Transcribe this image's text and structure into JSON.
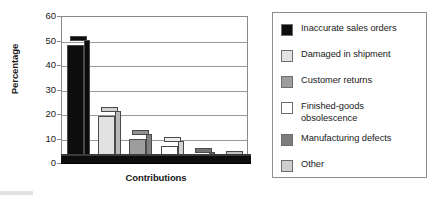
{
  "chart_data": {
    "type": "bar",
    "title": "",
    "xlabel": "Contributions",
    "ylabel": "Percentage",
    "ylim": [
      0,
      60
    ],
    "yticks": [
      0,
      10,
      20,
      30,
      40,
      50,
      60
    ],
    "grid": true,
    "legend_position": "right",
    "categories": [
      "Inaccurate sales orders",
      "Damaged in shipment",
      "Customer returns",
      "Finished-goods obsolescence",
      "Manufacturing defects",
      "Other"
    ],
    "values": [
      48,
      19,
      10,
      7,
      2.5,
      1
    ],
    "colors": [
      "#0d0d0d",
      "#e2e2e2",
      "#9d9d9d",
      "#ffffff",
      "#7d7d7d",
      "#cfcfcf"
    ]
  },
  "axes": {
    "y_title": "Percentage",
    "x_title": "Contributions",
    "y_tick_labels": [
      "60",
      "50",
      "40",
      "30",
      "20",
      "10",
      "0"
    ]
  },
  "legend": {
    "items": [
      {
        "label": "Inaccurate sales orders",
        "color": "#0d0d0d"
      },
      {
        "label": "Damaged in shipment",
        "color": "#e2e2e2"
      },
      {
        "label": "Customer returns",
        "color": "#9d9d9d"
      },
      {
        "label": "Finished-goods\nobsolescence",
        "color": "#ffffff"
      },
      {
        "label": "Manufacturing defects",
        "color": "#7d7d7d"
      },
      {
        "label": "Other",
        "color": "#cfcfcf"
      }
    ]
  }
}
